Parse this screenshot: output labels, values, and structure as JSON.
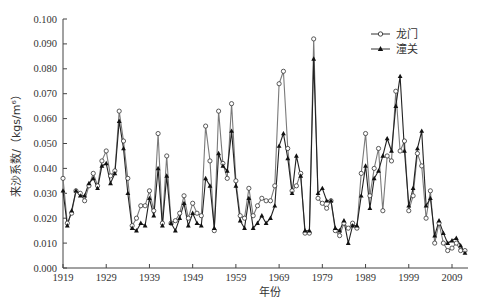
{
  "chart_data": {
    "type": "line",
    "title": "",
    "xlabel": "年份",
    "ylabel": "来沙系数/（kgs/m⁶）",
    "xlim": [
      1919,
      2013
    ],
    "ylim": [
      0,
      0.1
    ],
    "x_ticks": [
      1919,
      1929,
      1939,
      1949,
      1959,
      1969,
      1979,
      1989,
      1999,
      2009
    ],
    "y_ticks": [
      "0.000",
      "0.010",
      "0.020",
      "0.030",
      "0.040",
      "0.050",
      "0.060",
      "0.070",
      "0.080",
      "0.090",
      "0.100"
    ],
    "grid": false,
    "legend_position": "top-right",
    "x": [
      1919,
      1920,
      1921,
      1922,
      1923,
      1924,
      1925,
      1926,
      1927,
      1928,
      1929,
      1930,
      1931,
      1932,
      1933,
      1934,
      1935,
      1936,
      1937,
      1938,
      1939,
      1940,
      1941,
      1942,
      1943,
      1944,
      1945,
      1946,
      1947,
      1948,
      1949,
      1950,
      1951,
      1952,
      1953,
      1954,
      1955,
      1956,
      1957,
      1958,
      1959,
      1960,
      1961,
      1962,
      1963,
      1964,
      1965,
      1966,
      1967,
      1968,
      1969,
      1970,
      1971,
      1972,
      1973,
      1974,
      1975,
      1976,
      1977,
      1978,
      1979,
      1980,
      1981,
      1982,
      1983,
      1984,
      1985,
      1986,
      1987,
      1988,
      1989,
      1990,
      1991,
      1992,
      1993,
      1994,
      1995,
      1996,
      1997,
      1998,
      1999,
      2000,
      2001,
      2002,
      2003,
      2004,
      2005,
      2006,
      2007,
      2008,
      2009,
      2010,
      2011,
      2012
    ],
    "series": [
      {
        "name": "龙门",
        "marker": "open-circle",
        "values": [
          0.036,
          0.018,
          0.022,
          0.031,
          0.03,
          0.027,
          0.033,
          0.038,
          0.033,
          0.043,
          0.047,
          0.037,
          0.039,
          0.063,
          0.051,
          0.036,
          0.017,
          0.02,
          0.025,
          0.025,
          0.031,
          0.023,
          0.054,
          0.018,
          0.045,
          0.018,
          0.019,
          0.022,
          0.029,
          0.02,
          0.026,
          0.022,
          0.021,
          0.057,
          0.043,
          0.015,
          0.063,
          0.042,
          0.036,
          0.066,
          0.035,
          0.021,
          0.02,
          0.032,
          0.021,
          0.025,
          0.028,
          0.027,
          0.027,
          0.033,
          0.074,
          0.079,
          0.048,
          0.031,
          0.033,
          0.038,
          0.014,
          0.014,
          0.092,
          0.028,
          0.026,
          0.024,
          0.027,
          0.015,
          0.013,
          0.018,
          0.016,
          0.018,
          0.016,
          0.038,
          0.054,
          0.029,
          0.04,
          0.048,
          0.023,
          0.045,
          0.043,
          0.071,
          0.047,
          0.051,
          0.023,
          0.029,
          0.046,
          0.041,
          0.02,
          0.031,
          0.01,
          0.018,
          0.01,
          0.007,
          0.008,
          0.01,
          0.007,
          0.007
        ]
      },
      {
        "name": "潼关",
        "marker": "filled-triangle",
        "values": [
          0.031,
          0.017,
          0.023,
          0.031,
          0.029,
          0.029,
          0.034,
          0.036,
          0.032,
          0.041,
          0.042,
          0.034,
          0.038,
          0.059,
          0.048,
          0.03,
          0.016,
          0.015,
          0.018,
          0.017,
          0.028,
          0.021,
          0.04,
          0.017,
          0.037,
          0.018,
          0.015,
          0.02,
          0.026,
          0.017,
          0.022,
          0.018,
          0.017,
          0.036,
          0.033,
          0.016,
          0.046,
          0.041,
          0.039,
          0.055,
          0.033,
          0.019,
          0.016,
          0.028,
          0.016,
          0.018,
          0.021,
          0.018,
          0.02,
          0.025,
          0.049,
          0.054,
          0.044,
          0.03,
          0.045,
          0.037,
          0.015,
          0.015,
          0.084,
          0.03,
          0.032,
          0.027,
          0.027,
          0.016,
          0.015,
          0.019,
          0.01,
          0.017,
          0.017,
          0.029,
          0.041,
          0.024,
          0.036,
          0.039,
          0.045,
          0.052,
          0.047,
          0.065,
          0.077,
          0.047,
          0.025,
          0.032,
          0.048,
          0.055,
          0.025,
          0.028,
          0.013,
          0.019,
          0.014,
          0.01,
          0.011,
          0.012,
          0.009,
          0.006
        ]
      }
    ]
  }
}
